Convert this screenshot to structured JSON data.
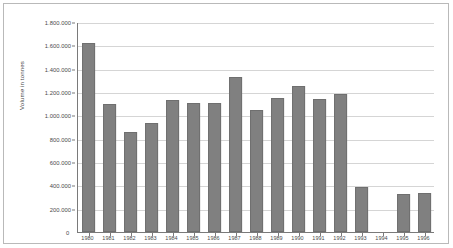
{
  "chart_data": {
    "type": "bar",
    "title": "",
    "subtitle": "",
    "xlabel": "",
    "ylabel": "Volume in tonnes",
    "categories": [
      "1980",
      "1981",
      "1982",
      "1983",
      "1984",
      "1985",
      "1986",
      "1987",
      "1988",
      "1989",
      "1990",
      "1991",
      "1992",
      "1993",
      "1994",
      "1995",
      "1996"
    ],
    "values": [
      1620000,
      1100000,
      855000,
      935000,
      1130000,
      1105000,
      1110000,
      1330000,
      1045000,
      1150000,
      1255000,
      1140000,
      1185000,
      385000,
      0,
      330000,
      335000
    ],
    "ylim": [
      0,
      1800000
    ],
    "ytick_values": [
      200000,
      400000,
      600000,
      800000,
      1000000,
      1200000,
      1400000,
      1600000,
      1800000
    ],
    "ytick_labels": [
      "200.000",
      "400.000",
      "600.000",
      "800.000",
      "1.000.000",
      "1.200.000",
      "1.400.000",
      "1.600.000",
      "1.800.000"
    ],
    "zero_label": "0",
    "grid": true,
    "legend": "none",
    "bar_color": "#808080",
    "grid_color": "#d5d5d5",
    "axis_color": "#7a7a7a"
  }
}
